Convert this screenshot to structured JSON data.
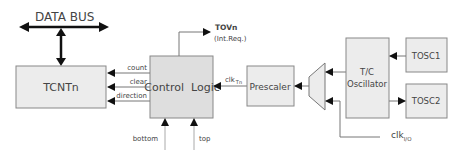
{
  "colors": {
    "box_fill": "#ececec",
    "box_stroke": "#888888",
    "line": "#777777",
    "arrow": "#111111",
    "text": "#444444"
  },
  "bus": {
    "label": "DATA BUS"
  },
  "blocks": {
    "tcnt": "TCNTn",
    "control_logic": "Control  Logic",
    "prescaler": "Prescaler",
    "oscillator_line1": "T/C",
    "oscillator_line2": "Oscillator",
    "tosc1": "TOSC1",
    "tosc2": "TOSC2"
  },
  "signals": {
    "count": "count",
    "clear": "clear",
    "direction": "direction",
    "tov": "TOVn",
    "tov_note": "(Int.Req.)",
    "clk_tn": "clk",
    "clk_tn_sub": "Tn",
    "clk_io": "clk",
    "clk_io_sub": "I/O",
    "bottom": "bottom",
    "top": "top"
  }
}
